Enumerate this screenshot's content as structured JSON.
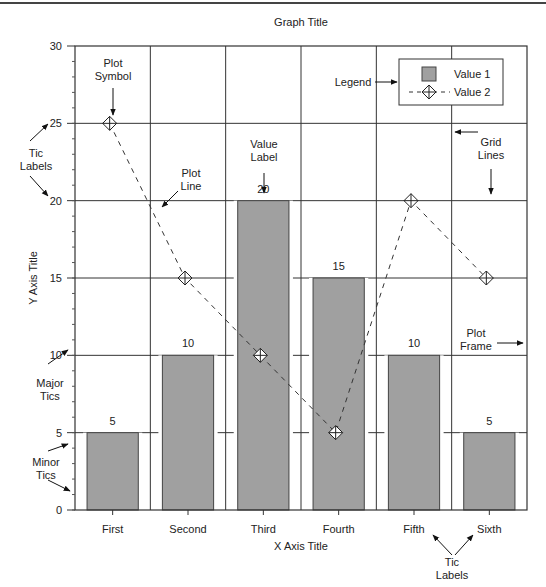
{
  "chart_data": {
    "type": "bar",
    "title": "Graph Title",
    "xlabel": "X Axis Title",
    "ylabel": "Y Axis Title",
    "categories": [
      "First",
      "Second",
      "Third",
      "Fourth",
      "Fifth",
      "Sixth"
    ],
    "series": [
      {
        "name": "Value 1",
        "kind": "bar",
        "values": [
          5,
          10,
          20,
          15,
          10,
          5
        ],
        "color": "#a0a0a0"
      },
      {
        "name": "Value 2",
        "kind": "line",
        "style": "dashed",
        "marker": "diamond-cross",
        "values": [
          25,
          15,
          10,
          5,
          20,
          15
        ],
        "color": "#333333"
      }
    ],
    "ylim": [
      0,
      30
    ],
    "yticks": [
      0,
      5,
      10,
      15,
      20,
      25,
      30
    ],
    "minor_ticks_per_major": 5,
    "grid": true,
    "legend_position": "upper-right",
    "value_labels": [
      "5",
      "10",
      "20",
      "15",
      "10",
      "5"
    ],
    "annotations": [
      {
        "id": "plot-symbol",
        "text": [
          "Plot",
          "Symbol"
        ]
      },
      {
        "id": "tic-labels-y",
        "text": [
          "Tic",
          "Labels"
        ]
      },
      {
        "id": "plot-line",
        "text": [
          "Plot",
          "Line"
        ]
      },
      {
        "id": "value-label",
        "text": [
          "Value",
          "Label"
        ]
      },
      {
        "id": "legend",
        "text": [
          "Legend"
        ]
      },
      {
        "id": "grid-lines",
        "text": [
          "Grid",
          "Lines"
        ]
      },
      {
        "id": "plot-frame",
        "text": [
          "Plot",
          "Frame"
        ]
      },
      {
        "id": "major-tics",
        "text": [
          "Major",
          "Tics"
        ]
      },
      {
        "id": "minor-tics",
        "text": [
          "Minor",
          "Tics"
        ]
      },
      {
        "id": "tic-labels-x",
        "text": [
          "Tic",
          "Labels"
        ]
      }
    ]
  },
  "legend": {
    "item1": "Value 1",
    "item2": "Value 2"
  },
  "colors": {
    "bar": "#a0a0a0",
    "line": "#333333",
    "grid": "#333333"
  }
}
